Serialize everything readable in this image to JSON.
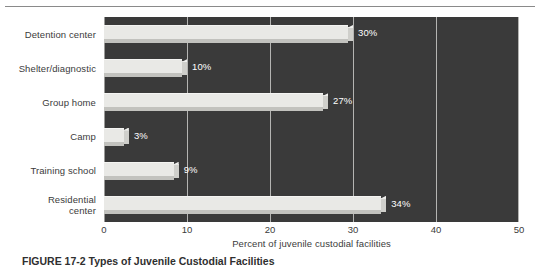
{
  "figure": {
    "caption_number": "FIGURE 17-2",
    "caption_title": "Types of Juvenile Custodial Facilities"
  },
  "chart_data": {
    "type": "bar",
    "orientation": "horizontal",
    "title": "",
    "subtitle": "",
    "xlabel": "Percent of juvenile custodial facilities",
    "ylabel": "",
    "xlim": [
      0,
      50
    ],
    "xticks": [
      0,
      10,
      20,
      30,
      40,
      50
    ],
    "xtick_labels": [
      "0",
      "10",
      "20",
      "30",
      "40",
      "50"
    ],
    "grid": true,
    "grid_axis": "x",
    "legend": false,
    "legend_position": "none",
    "categories": [
      "Detention center",
      "Shelter/diagnostic",
      "Group home",
      "Camp",
      "Training school",
      "Residential center"
    ],
    "category_lines": [
      [
        "Detention center"
      ],
      [
        "Shelter/diagnostic"
      ],
      [
        "Group home"
      ],
      [
        "Camp"
      ],
      [
        "Training school"
      ],
      [
        "Residential",
        "center"
      ]
    ],
    "values": [
      30,
      10,
      27,
      3,
      9,
      34
    ],
    "data_labels": [
      "30%",
      "10%",
      "27%",
      "3%",
      "9%",
      "34%"
    ],
    "colors": {
      "plot_background": "#3a3a3a",
      "bar_face": "#e9e9e6",
      "bar_shadow": "#c2c2be",
      "bar_side": "#cfcfcb",
      "gridline": "#b4b4b2",
      "data_label_text": "#ffffff",
      "axis_text": "#3b3b3b",
      "page_background": "#ffffff",
      "top_rule": "#8a8a8a"
    }
  }
}
